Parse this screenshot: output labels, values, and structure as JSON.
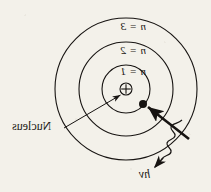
{
  "figure": {
    "background_color": "#f3f1ea",
    "ink_color": "#171412",
    "mirrored": true,
    "center": {
      "x": 126,
      "y": 89
    },
    "shells": [
      {
        "name": "n-1",
        "label": "n = 1",
        "radius": 24
      },
      {
        "name": "n-2",
        "label": "n = 2",
        "radius": 47
      },
      {
        "name": "n-3",
        "label": "n = 3",
        "radius": 71
      }
    ],
    "nucleus": {
      "label": "Nucleus",
      "symbol": "+",
      "radius": 6
    },
    "electron": {
      "label": "",
      "x": 143,
      "y": 104,
      "radius": 4
    },
    "photon": {
      "label": "hv",
      "wave_start": {
        "x": 182,
        "y": 121
      },
      "wave_end": {
        "x": 156,
        "y": 163
      }
    },
    "transition_arrow": {
      "from": {
        "x": 188,
        "y": 138
      },
      "to": {
        "x": 147,
        "y": 106
      }
    },
    "leader_line": {
      "from": {
        "x": 64,
        "y": 128
      },
      "to": {
        "x": 119,
        "y": 95
      }
    }
  }
}
